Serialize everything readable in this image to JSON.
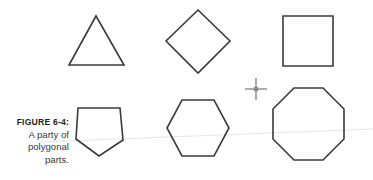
{
  "figure": {
    "label": "FIGURE 6-4:",
    "caption_lines": [
      "A party of",
      "polygonal",
      "parts."
    ],
    "caption_full": "FIGURE 6-4: A party of polygonal parts.",
    "background_color": "#ffffff",
    "stroke_color": "#3a393b",
    "label_color": "#231f20",
    "caption_color": "#3b3a3c",
    "guide_line_color": "#e2e0e4",
    "cursor_color": "#6e6e72"
  },
  "shapes": [
    {
      "name": "triangle",
      "sides": 3,
      "label": "Triangle",
      "points": "96,16 124,65 69,65"
    },
    {
      "name": "diamond",
      "sides": 4,
      "label": "Diamond",
      "points": "198,10 230,41 198,73 166,41"
    },
    {
      "name": "square",
      "sides": 4,
      "label": "Square",
      "points": "283,16 333,16 333,66 283,66"
    },
    {
      "name": "pentagon",
      "sides": 5,
      "label": "Pentagon",
      "points": "78,108 120,108 123,140 99,156 76,139"
    },
    {
      "name": "hexagon",
      "sides": 6,
      "label": "Hexagon",
      "points": "182,100 214,100 229,128 214,156 182,156 167,128"
    },
    {
      "name": "octagon",
      "sides": 8,
      "label": "Octagon",
      "points": "294,88 323,88 344,109 344,139 323,160 294,160 273,139 273,109"
    }
  ],
  "cursor": {
    "name": "crosshair-cursor",
    "x": 256,
    "y": 89,
    "arm_length": 11
  },
  "guide_line": {
    "x1": 40,
    "y1": 142,
    "x2": 373,
    "y2": 129
  }
}
